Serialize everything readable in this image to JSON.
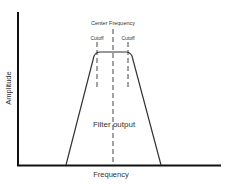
{
  "diagram": {
    "title_label": "Center Frequency",
    "cutoff_left_label": "Cutoff",
    "cutoff_right_label": "Cutoff",
    "curve_label": "Filter output",
    "x_axis_label": "Frequency",
    "y_axis_label": "Amplitude",
    "colors": {
      "axis": "#111111",
      "curve": "#333333",
      "dashed": "#444444",
      "text": "#333333"
    }
  }
}
